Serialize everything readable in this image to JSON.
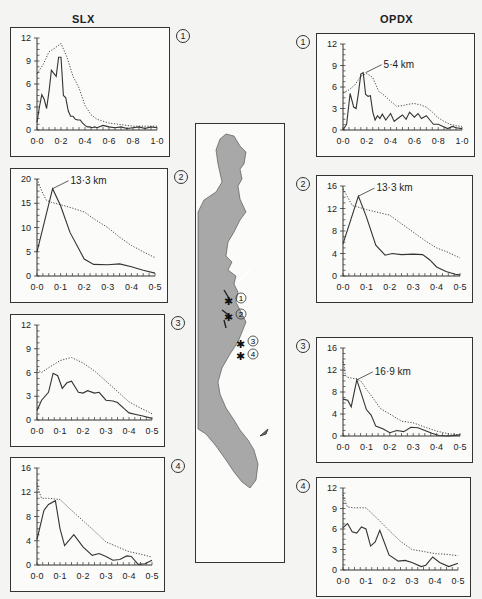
{
  "columns": {
    "left_title": "SLX",
    "right_title": "OPDX"
  },
  "colors": {
    "line": "#333333",
    "map_fill": "#a8a8a8",
    "frame": "#333333",
    "bg": "#f4f4f2"
  },
  "map": {
    "sites": [
      "1",
      "2",
      "3",
      "4"
    ]
  },
  "chart_data": [
    {
      "id": "SLX-1",
      "type": "line",
      "column": "SLX",
      "site": "1",
      "box": [
        10,
        27,
        160,
        130
      ],
      "xlim": [
        0,
        1.0
      ],
      "ylim": [
        0,
        12
      ],
      "xticks": [
        "0·0",
        "0·2",
        "0·4",
        "0·6",
        "0·8",
        "1·0"
      ],
      "xtick_values": [
        0,
        0.2,
        0.4,
        0.6,
        0.8,
        1.0
      ],
      "yticks": [
        "0",
        "3",
        "6",
        "9",
        "12"
      ],
      "ytick_values": [
        0,
        3,
        6,
        9,
        12
      ],
      "annotation": null,
      "series": [
        {
          "name": "solid",
          "style": "solid",
          "x": [
            0,
            0.02,
            0.04,
            0.06,
            0.08,
            0.1,
            0.12,
            0.14,
            0.16,
            0.18,
            0.2,
            0.22,
            0.24,
            0.26,
            0.28,
            0.3,
            0.32,
            0.34,
            0.36,
            0.38,
            0.4,
            0.42,
            0.44,
            0.46,
            0.48,
            0.5,
            0.55,
            0.6,
            0.65,
            0.7,
            0.75,
            0.8,
            0.85,
            0.9,
            0.95,
            1.0
          ],
          "y": [
            1,
            3,
            4.6,
            4,
            2.8,
            5,
            7.8,
            7.4,
            7,
            9.5,
            9.5,
            4.5,
            4.2,
            2.5,
            1.8,
            1.8,
            1.4,
            1.3,
            1.3,
            0.9,
            0.6,
            0.4,
            0.4,
            0.3,
            0.4,
            0.3,
            0.6,
            0.4,
            0.3,
            0.4,
            0.2,
            0.3,
            0.4,
            0.2,
            0.4,
            0.3
          ]
        },
        {
          "name": "dotted",
          "style": "dotted",
          "x": [
            0,
            0.05,
            0.1,
            0.15,
            0.2,
            0.25,
            0.3,
            0.35,
            0.4,
            0.45,
            0.5,
            0.6,
            0.7,
            0.8,
            0.9,
            1.0
          ],
          "y": [
            7.3,
            8.5,
            10.2,
            10.7,
            11.3,
            9.5,
            7,
            5.5,
            3.2,
            2,
            1.4,
            0.9,
            0.7,
            0.5,
            0.5,
            0.5
          ]
        }
      ]
    },
    {
      "id": "SLX-2",
      "type": "line",
      "column": "SLX",
      "site": "2",
      "box": [
        10,
        168,
        158,
        135
      ],
      "xlim": [
        0,
        0.5
      ],
      "ylim": [
        0,
        20
      ],
      "xticks": [
        "0·0",
        "0·1",
        "0·2",
        "0·3",
        "0·4",
        "0·5"
      ],
      "xtick_values": [
        0,
        0.1,
        0.2,
        0.3,
        0.4,
        0.5
      ],
      "yticks": [
        "0",
        "5",
        "10",
        "15",
        "20"
      ],
      "ytick_values": [
        0,
        5,
        10,
        15,
        20
      ],
      "annotation": {
        "text": "13·3 km",
        "x": 0.066,
        "y": 18
      },
      "series": [
        {
          "name": "solid",
          "style": "solid",
          "x": [
            0,
            0.066,
            0.1,
            0.14,
            0.2,
            0.24,
            0.3,
            0.35,
            0.4,
            0.45,
            0.5
          ],
          "y": [
            5,
            18,
            14.5,
            9,
            3.5,
            2.4,
            2.3,
            2.5,
            1.9,
            1.2,
            0.6
          ]
        },
        {
          "name": "dotted",
          "style": "dotted",
          "x": [
            0,
            0.02,
            0.04,
            0.06,
            0.1,
            0.15,
            0.2,
            0.25,
            0.3,
            0.35,
            0.4,
            0.45,
            0.5
          ],
          "y": [
            20,
            17.5,
            15.6,
            15.2,
            14.7,
            14,
            13.2,
            11.5,
            10,
            8,
            6.3,
            5,
            3.8
          ]
        }
      ]
    },
    {
      "id": "SLX-3",
      "type": "line",
      "column": "SLX",
      "site": "3",
      "box": [
        10,
        314,
        155,
        133
      ],
      "xlim": [
        0,
        0.5
      ],
      "ylim": [
        0,
        12
      ],
      "xticks": [
        "0·0",
        "0·1",
        "0·2",
        "0·3",
        "0·4",
        "0·5"
      ],
      "xtick_values": [
        0,
        0.1,
        0.2,
        0.3,
        0.4,
        0.5
      ],
      "yticks": [
        "0",
        "3",
        "6",
        "9",
        "12"
      ],
      "ytick_values": [
        0,
        3,
        6,
        9,
        12
      ],
      "annotation": null,
      "series": [
        {
          "name": "solid",
          "style": "solid",
          "x": [
            0,
            0.02,
            0.05,
            0.07,
            0.09,
            0.11,
            0.13,
            0.15,
            0.18,
            0.2,
            0.22,
            0.25,
            0.27,
            0.3,
            0.33,
            0.35,
            0.38,
            0.4,
            0.43,
            0.46,
            0.5
          ],
          "y": [
            1.2,
            2.5,
            3.5,
            5.9,
            5.6,
            4,
            4.7,
            4.9,
            3.5,
            3.4,
            3.7,
            3.4,
            3.5,
            2.5,
            2.4,
            2.2,
            1.4,
            0.9,
            0.7,
            0.5,
            0.2
          ]
        },
        {
          "name": "dotted",
          "style": "dotted",
          "x": [
            0,
            0.02,
            0.05,
            0.1,
            0.15,
            0.2,
            0.25,
            0.3,
            0.35,
            0.4,
            0.45,
            0.5
          ],
          "y": [
            6.4,
            6,
            6.6,
            7.5,
            7.9,
            7.2,
            6.2,
            4.9,
            3.6,
            2.3,
            1.5,
            0.8
          ]
        }
      ]
    },
    {
      "id": "SLX-4",
      "type": "line",
      "column": "SLX",
      "site": "4",
      "box": [
        10,
        457,
        155,
        135
      ],
      "xlim": [
        0,
        0.5
      ],
      "ylim": [
        0,
        16
      ],
      "xticks": [
        "0·0",
        "0·1",
        "0·2",
        "0·3",
        "0·4",
        "0·5"
      ],
      "xtick_values": [
        0,
        0.1,
        0.2,
        0.3,
        0.4,
        0.5
      ],
      "yticks": [
        "0",
        "4",
        "8",
        "12",
        "16"
      ],
      "ytick_values": [
        0,
        4,
        8,
        12,
        16
      ],
      "annotation": null,
      "series": [
        {
          "name": "solid",
          "style": "solid",
          "x": [
            0,
            0.03,
            0.05,
            0.08,
            0.1,
            0.12,
            0.16,
            0.2,
            0.24,
            0.27,
            0.3,
            0.33,
            0.36,
            0.39,
            0.41,
            0.44,
            0.47,
            0.5
          ],
          "y": [
            4.2,
            9,
            10,
            10.6,
            6,
            3.2,
            5,
            3,
            1.6,
            1.9,
            1.4,
            0.8,
            0.9,
            1.5,
            1.4,
            0.1,
            0.2,
            0.8
          ]
        },
        {
          "name": "dotted",
          "style": "dotted",
          "x": [
            0,
            0.01,
            0.02,
            0.05,
            0.1,
            0.15,
            0.2,
            0.25,
            0.3,
            0.35,
            0.4,
            0.45,
            0.5
          ],
          "y": [
            13.5,
            12,
            11,
            11,
            10.8,
            9,
            7.3,
            5.6,
            3.8,
            3,
            2.2,
            1.8,
            1.3
          ]
        }
      ]
    },
    {
      "id": "OPDX-1",
      "type": "line",
      "column": "OPDX",
      "site": "1",
      "box": [
        316,
        33,
        159,
        124
      ],
      "xlim": [
        0,
        1.0
      ],
      "ylim": [
        0,
        12
      ],
      "xticks": [
        "0·0",
        "0·2",
        "0·4",
        "0·6",
        "0·8",
        "1·0"
      ],
      "xtick_values": [
        0,
        0.2,
        0.4,
        0.6,
        0.8,
        1.0
      ],
      "yticks": [
        "0",
        "3",
        "6",
        "9",
        "12"
      ],
      "ytick_values": [
        0,
        3,
        6,
        9,
        12
      ],
      "annotation": {
        "text": "5·4 km",
        "x": 0.19,
        "y": 8
      },
      "series": [
        {
          "name": "solid",
          "style": "solid",
          "x": [
            0,
            0.03,
            0.06,
            0.09,
            0.11,
            0.13,
            0.15,
            0.17,
            0.19,
            0.21,
            0.23,
            0.25,
            0.27,
            0.29,
            0.31,
            0.33,
            0.36,
            0.4,
            0.43,
            0.46,
            0.5,
            0.53,
            0.56,
            0.6,
            0.63,
            0.66,
            0.7,
            0.73,
            0.76,
            0.8,
            0.84,
            0.88,
            0.92,
            0.95,
            1.0
          ],
          "y": [
            0,
            0.8,
            5.1,
            3.2,
            3,
            5.2,
            7.8,
            8,
            5,
            4.7,
            4.8,
            2.5,
            1.4,
            2,
            1.6,
            2.2,
            1.4,
            2.3,
            1.2,
            1.6,
            2.1,
            1.5,
            2.5,
            1.8,
            2.3,
            1.6,
            2,
            1.4,
            0.8,
            0.8,
            0.5,
            0.2,
            0.5,
            0.3,
            0.2
          ]
        },
        {
          "name": "dotted",
          "style": "dotted",
          "x": [
            0,
            0.05,
            0.1,
            0.15,
            0.2,
            0.25,
            0.3,
            0.35,
            0.4,
            0.45,
            0.5,
            0.55,
            0.6,
            0.65,
            0.7,
            0.75,
            0.8,
            0.85,
            0.9,
            0.95,
            1.0
          ],
          "y": [
            5.2,
            5.6,
            6.3,
            7.5,
            7.9,
            7.3,
            5.4,
            4.8,
            4,
            3.3,
            3.4,
            3.6,
            3.7,
            3.5,
            3.2,
            2.5,
            1.7,
            1.2,
            0.8,
            0.6,
            0.5
          ]
        }
      ]
    },
    {
      "id": "OPDX-2",
      "type": "line",
      "column": "OPDX",
      "site": "2",
      "box": [
        316,
        175,
        157,
        128
      ],
      "xlim": [
        0,
        0.5
      ],
      "ylim": [
        0,
        16
      ],
      "xticks": [
        "0·0",
        "0·1",
        "0·2",
        "0·3",
        "0·4",
        "0·5"
      ],
      "xtick_values": [
        0,
        0.1,
        0.2,
        0.3,
        0.4,
        0.5
      ],
      "yticks": [
        "0",
        "4",
        "8",
        "12",
        "16"
      ],
      "ytick_values": [
        0,
        4,
        8,
        12,
        16
      ],
      "annotation": {
        "text": "13·3 km",
        "x": 0.066,
        "y": 14.2
      },
      "series": [
        {
          "name": "solid",
          "style": "solid",
          "x": [
            0,
            0.066,
            0.1,
            0.14,
            0.18,
            0.21,
            0.25,
            0.3,
            0.34,
            0.37,
            0.4,
            0.44,
            0.48,
            0.5
          ],
          "y": [
            5.7,
            14.2,
            10.5,
            5.5,
            3.7,
            4,
            3.8,
            3.9,
            3.8,
            2.9,
            1.6,
            0.8,
            0.3,
            0.2
          ]
        },
        {
          "name": "dotted",
          "style": "dotted",
          "x": [
            0,
            0.02,
            0.04,
            0.07,
            0.1,
            0.15,
            0.2,
            0.25,
            0.3,
            0.35,
            0.4,
            0.45,
            0.5
          ],
          "y": [
            15.5,
            14,
            12.5,
            12.2,
            11.8,
            11.3,
            10.8,
            9.3,
            7.8,
            6.3,
            5,
            4.2,
            3.2
          ]
        }
      ]
    },
    {
      "id": "OPDX-3",
      "type": "line",
      "column": "OPDX",
      "site": "3",
      "box": [
        316,
        337,
        157,
        126
      ],
      "xlim": [
        0,
        0.5
      ],
      "ylim": [
        0,
        16
      ],
      "xticks": [
        "0·0",
        "0·1",
        "0·2",
        "0·3",
        "0·4",
        "0·5"
      ],
      "xtick_values": [
        0,
        0.1,
        0.2,
        0.3,
        0.4,
        0.5
      ],
      "yticks": [
        "0",
        "4",
        "8",
        "12",
        "16"
      ],
      "ytick_values": [
        0,
        4,
        8,
        12,
        16
      ],
      "annotation": {
        "text": "16·9 km",
        "x": 0.059,
        "y": 10.2
      },
      "series": [
        {
          "name": "solid",
          "style": "solid",
          "x": [
            0,
            0.02,
            0.035,
            0.059,
            0.08,
            0.1,
            0.12,
            0.14,
            0.17,
            0.2,
            0.23,
            0.26,
            0.29,
            0.32,
            0.35,
            0.38,
            0.41,
            0.45,
            0.5
          ],
          "y": [
            6.7,
            6.5,
            5.3,
            10.2,
            7.5,
            4.8,
            3.8,
            1.8,
            1.3,
            0.6,
            1,
            0.8,
            1.6,
            1.5,
            1,
            0.5,
            0.1,
            0,
            0.2
          ]
        },
        {
          "name": "dotted",
          "style": "dotted",
          "x": [
            0,
            0.005,
            0.01,
            0.02,
            0.04,
            0.059,
            0.08,
            0.1,
            0.13,
            0.16,
            0.2,
            0.25,
            0.3,
            0.35,
            0.4,
            0.45,
            0.5
          ],
          "y": [
            13.5,
            12.8,
            11,
            10.7,
            10.5,
            10.4,
            9.8,
            8.5,
            6.8,
            5,
            4,
            2.7,
            2.4,
            1.6,
            0.9,
            0.4,
            0.2
          ]
        }
      ]
    },
    {
      "id": "OPDX-4",
      "type": "line",
      "column": "OPDX",
      "site": "4",
      "box": [
        316,
        477,
        155,
        120
      ],
      "xlim": [
        0,
        0.5
      ],
      "ylim": [
        0,
        12
      ],
      "xticks": [
        "0·0",
        "0·1",
        "0·2",
        "0·3",
        "0·4",
        "0·5"
      ],
      "xtick_values": [
        0,
        0.1,
        0.2,
        0.3,
        0.4,
        0.5
      ],
      "yticks": [
        "0",
        "3",
        "6",
        "9",
        "12"
      ],
      "ytick_values": [
        0,
        3,
        6,
        9,
        12
      ],
      "annotation": null,
      "series": [
        {
          "name": "solid",
          "style": "solid",
          "x": [
            0,
            0.02,
            0.04,
            0.06,
            0.08,
            0.1,
            0.12,
            0.14,
            0.16,
            0.2,
            0.24,
            0.27,
            0.3,
            0.34,
            0.36,
            0.39,
            0.42,
            0.46,
            0.5
          ],
          "y": [
            6.2,
            6.8,
            5.6,
            5.4,
            6.3,
            6,
            3.5,
            4.1,
            5.8,
            2.2,
            1.3,
            1.4,
            1.1,
            0.5,
            0.7,
            1.9,
            1.1,
            0.5,
            1
          ]
        },
        {
          "name": "dotted",
          "style": "dotted",
          "x": [
            0,
            0.01,
            0.02,
            0.05,
            0.1,
            0.15,
            0.2,
            0.25,
            0.3,
            0.35,
            0.4,
            0.45,
            0.5
          ],
          "y": [
            11,
            10,
            9.2,
            9.1,
            9.1,
            7.5,
            5.8,
            4.2,
            3,
            2.7,
            2.4,
            2.3,
            2.1
          ]
        }
      ]
    }
  ]
}
